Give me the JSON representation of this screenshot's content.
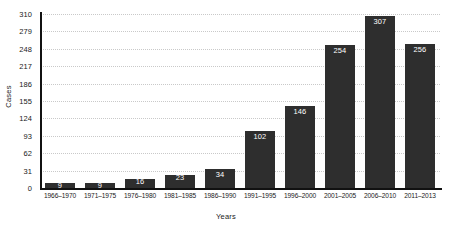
{
  "chart_data": {
    "type": "bar",
    "title": "",
    "xlabel": "Years",
    "ylabel": "Cases",
    "categories": [
      "1966–1970",
      "1971–1975",
      "1976–1980",
      "1981–1985",
      "1986–1990",
      "1991–1995",
      "1996–2000",
      "2001–2005",
      "2006–2010",
      "2011–2013"
    ],
    "values": [
      9,
      9,
      16,
      23,
      34,
      102,
      146,
      254,
      307,
      256
    ],
    "value_labels": [
      "9",
      "9",
      "16",
      "23",
      "34",
      "102",
      "146",
      "254",
      "307",
      "256"
    ],
    "ylim": [
      0,
      310
    ],
    "yticks": [
      0,
      31,
      62,
      93,
      124,
      155,
      186,
      217,
      248,
      279,
      310
    ],
    "ytick_labels": [
      "0",
      "31",
      "62",
      "93",
      "124",
      "155",
      "186",
      "217",
      "248",
      "279",
      "310"
    ],
    "grid": true,
    "grid_axis": "y",
    "grid_style": "dotted",
    "legend": "none",
    "bar_color": "#2e2e2e",
    "value_label_color": "#ffffff",
    "axis_color": "#111111",
    "grid_color": "#c9c9c9",
    "background_color": "#ffffff"
  }
}
